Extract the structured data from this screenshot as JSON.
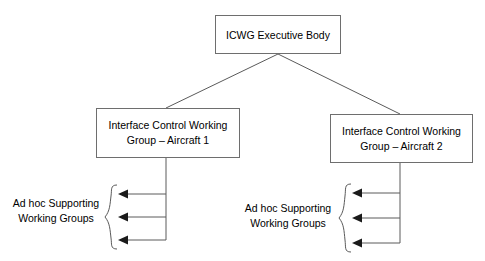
{
  "diagram": {
    "type": "org-chart",
    "background_color": "#ffffff",
    "line_color": "#5a5a5a",
    "box_border_color": "#6e6e6e",
    "text_color": "#000000",
    "nodes": {
      "executive": {
        "label": "ICWG Executive Body"
      },
      "icwg_aircraft_1": {
        "label": "Interface Control Working\nGroup – Aircraft 1"
      },
      "icwg_aircraft_2": {
        "label": "Interface Control Working\nGroup – Aircraft 2"
      },
      "adhoc_group_1": {
        "label": "Ad hoc Supporting\nWorking Groups",
        "arrow_count": 3
      },
      "adhoc_group_2": {
        "label": "Ad hoc Supporting\nWorking Groups",
        "arrow_count": 3
      }
    }
  }
}
